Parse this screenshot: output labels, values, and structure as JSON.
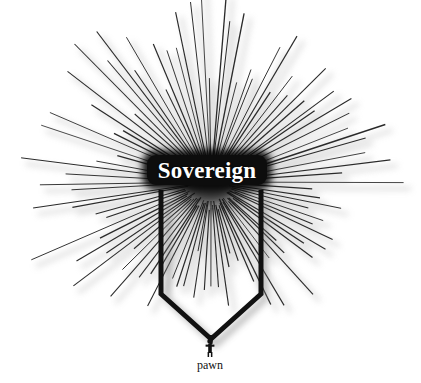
{
  "canvas": {
    "width": 421,
    "height": 383,
    "background_color": "#ffffff"
  },
  "diagram": {
    "title_node": {
      "label": "Sovereign",
      "text_color": "#ffffff",
      "fill_color": "#0d0d0d",
      "shape": "rounded-rectangle"
    },
    "bottom_node": {
      "label": "pawn",
      "icon": "person-silhouette-icon",
      "text_color": "#111111",
      "fill_color": "#111111"
    },
    "connector": {
      "name": "downward-arrow-bracket",
      "color": "#111111",
      "stroke_width": 5
    },
    "starburst": {
      "name": "radiating-rays",
      "ray_count": 96,
      "ray_color": "#2a2a2a",
      "shadow_color": "#b8b8b8",
      "center_x": 211,
      "center_y": 182,
      "min_radius": 18,
      "max_radius": 205
    }
  }
}
